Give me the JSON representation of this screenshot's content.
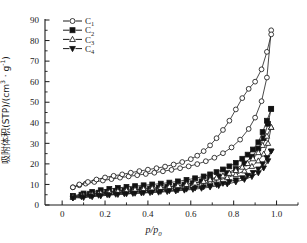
{
  "chart_data": {
    "type": "line",
    "title": "",
    "xlabel": "p/p0",
    "ylabel": "吸附体积(STP)/(cm³ · g⁻¹)",
    "xlim": [
      -0.08,
      1.1
    ],
    "ylim": [
      0,
      90
    ],
    "xticks": [
      0,
      0.2,
      0.4,
      0.6,
      0.8,
      1.0
    ],
    "xtick_labels": [
      "0",
      "0.2",
      "0.4",
      "0.6",
      "0.8",
      "1.0"
    ],
    "yticks": [
      0,
      10,
      20,
      30,
      40,
      50,
      60,
      70,
      80,
      90
    ],
    "ytick_labels": [
      "0",
      "10",
      "20",
      "30",
      "40",
      "50",
      "60",
      "70",
      "80",
      "90"
    ],
    "grid": false,
    "legend_position": "top-left",
    "note": "Nitrogen adsorption-desorption isotherms with hysteresis loops; each sample has an adsorption branch and a desorption branch.",
    "series": [
      {
        "name": "C1",
        "marker": "open-circle",
        "branch": "adsorption",
        "x": [
          0.05,
          0.08,
          0.11,
          0.15,
          0.19,
          0.23,
          0.27,
          0.31,
          0.35,
          0.39,
          0.43,
          0.47,
          0.51,
          0.55,
          0.59,
          0.63,
          0.67,
          0.71,
          0.75,
          0.79,
          0.83,
          0.87,
          0.9,
          0.93,
          0.955,
          0.975
        ],
        "y": [
          8.6,
          9.6,
          10.4,
          11.2,
          11.9,
          12.6,
          13.3,
          13.9,
          14.5,
          15.1,
          15.7,
          16.4,
          17.1,
          17.9,
          18.8,
          19.9,
          21.3,
          23.0,
          25.2,
          28.0,
          31.8,
          37.0,
          42.5,
          50.5,
          62.0,
          85.0
        ]
      },
      {
        "name": "C1",
        "marker": "open-circle",
        "branch": "desorption",
        "x": [
          0.975,
          0.955,
          0.93,
          0.9,
          0.87,
          0.84,
          0.81,
          0.78,
          0.75,
          0.72,
          0.69,
          0.66,
          0.63,
          0.6,
          0.56,
          0.52,
          0.48,
          0.44,
          0.4,
          0.36,
          0.32,
          0.28,
          0.24,
          0.2,
          0.16,
          0.12,
          0.08,
          0.05
        ],
        "y": [
          83.0,
          74.5,
          66.0,
          60.0,
          56.5,
          52.0,
          46.5,
          41.0,
          36.5,
          32.5,
          29.0,
          26.2,
          24.0,
          22.3,
          20.9,
          19.7,
          18.7,
          17.9,
          17.2,
          16.5,
          15.7,
          14.9,
          14.2,
          13.4,
          12.4,
          11.2,
          10.0,
          8.6
        ]
      },
      {
        "name": "C2",
        "marker": "filled-square",
        "branch": "adsorption",
        "x": [
          0.05,
          0.09,
          0.13,
          0.17,
          0.21,
          0.25,
          0.29,
          0.33,
          0.37,
          0.41,
          0.45,
          0.49,
          0.53,
          0.57,
          0.61,
          0.65,
          0.69,
          0.73,
          0.77,
          0.81,
          0.85,
          0.885,
          0.915,
          0.94,
          0.96,
          0.975
        ],
        "y": [
          4.2,
          5.0,
          5.5,
          6.0,
          6.4,
          6.8,
          7.1,
          7.4,
          7.7,
          8.0,
          8.4,
          8.8,
          9.3,
          9.9,
          10.6,
          11.5,
          12.6,
          13.9,
          15.5,
          17.5,
          20.2,
          23.5,
          27.5,
          32.5,
          39.5,
          46.8
        ]
      },
      {
        "name": "C2",
        "marker": "filled-square",
        "branch": "desorption",
        "x": [
          0.975,
          0.955,
          0.935,
          0.915,
          0.89,
          0.865,
          0.84,
          0.81,
          0.78,
          0.75,
          0.72,
          0.69,
          0.66,
          0.62,
          0.58,
          0.54,
          0.5,
          0.46,
          0.42,
          0.38,
          0.34,
          0.3,
          0.26,
          0.22,
          0.18,
          0.14,
          0.1,
          0.05
        ],
        "y": [
          46.8,
          41.0,
          35.5,
          30.5,
          27.0,
          24.5,
          22.5,
          20.5,
          18.8,
          17.3,
          16.0,
          14.9,
          13.9,
          13.0,
          12.2,
          11.5,
          10.9,
          10.4,
          10.0,
          9.6,
          9.2,
          8.8,
          8.3,
          7.8,
          7.2,
          6.4,
          5.6,
          4.4
        ]
      },
      {
        "name": "C3",
        "marker": "open-triangle-up",
        "branch": "adsorption",
        "x": [
          0.05,
          0.09,
          0.13,
          0.17,
          0.21,
          0.25,
          0.29,
          0.33,
          0.37,
          0.41,
          0.45,
          0.49,
          0.53,
          0.57,
          0.61,
          0.65,
          0.69,
          0.73,
          0.77,
          0.81,
          0.85,
          0.885,
          0.915,
          0.94,
          0.96,
          0.975
        ],
        "y": [
          3.8,
          4.5,
          5.0,
          5.4,
          5.8,
          6.1,
          6.4,
          6.7,
          7.0,
          7.3,
          7.6,
          8.0,
          8.4,
          8.9,
          9.5,
          10.2,
          11.1,
          12.1,
          13.3,
          14.8,
          16.6,
          18.8,
          21.5,
          24.8,
          30.0,
          37.8
        ]
      },
      {
        "name": "C3",
        "marker": "open-triangle-up",
        "branch": "desorption",
        "x": [
          0.975,
          0.955,
          0.935,
          0.915,
          0.89,
          0.865,
          0.84,
          0.81,
          0.78,
          0.75,
          0.72,
          0.69,
          0.66,
          0.62,
          0.58,
          0.54,
          0.5,
          0.46,
          0.42,
          0.38,
          0.34,
          0.3,
          0.26,
          0.22,
          0.18,
          0.14,
          0.1,
          0.05
        ],
        "y": [
          37.8,
          33.5,
          29.0,
          25.5,
          22.5,
          20.2,
          18.4,
          16.8,
          15.4,
          14.2,
          13.2,
          12.3,
          11.5,
          10.7,
          10.0,
          9.4,
          8.9,
          8.5,
          8.1,
          7.8,
          7.5,
          7.1,
          6.7,
          6.3,
          5.8,
          5.2,
          4.6,
          3.9
        ]
      },
      {
        "name": "C4",
        "marker": "filled-triangle-down",
        "branch": "adsorption",
        "x": [
          0.05,
          0.09,
          0.13,
          0.17,
          0.21,
          0.25,
          0.29,
          0.33,
          0.37,
          0.41,
          0.45,
          0.49,
          0.53,
          0.57,
          0.61,
          0.65,
          0.69,
          0.73,
          0.77,
          0.81,
          0.85,
          0.885,
          0.915,
          0.94,
          0.96,
          0.975
        ],
        "y": [
          3.4,
          4.0,
          4.4,
          4.7,
          5.0,
          5.2,
          5.4,
          5.6,
          5.8,
          6.0,
          6.2,
          6.5,
          6.8,
          7.2,
          7.6,
          8.1,
          8.7,
          9.4,
          10.2,
          11.2,
          12.4,
          13.8,
          15.6,
          18.0,
          21.5,
          26.2
        ]
      },
      {
        "name": "C4",
        "marker": "filled-triangle-down",
        "branch": "desorption",
        "x": [
          0.975,
          0.955,
          0.935,
          0.915,
          0.89,
          0.865,
          0.84,
          0.81,
          0.78,
          0.75,
          0.72,
          0.69,
          0.66,
          0.62,
          0.58,
          0.54,
          0.5,
          0.46,
          0.42,
          0.38,
          0.34,
          0.3,
          0.26,
          0.22,
          0.18,
          0.14,
          0.1,
          0.05
        ],
        "y": [
          26.2,
          23.0,
          20.0,
          17.5,
          15.8,
          14.4,
          13.2,
          12.2,
          11.3,
          10.5,
          9.9,
          9.3,
          8.8,
          8.2,
          7.7,
          7.3,
          6.9,
          6.6,
          6.3,
          6.0,
          5.7,
          5.4,
          5.1,
          4.8,
          4.4,
          4.0,
          3.6,
          3.4
        ]
      }
    ],
    "legend": [
      {
        "label": "C1",
        "sub": "1",
        "marker": "open-circle"
      },
      {
        "label": "C2",
        "sub": "2",
        "marker": "filled-square"
      },
      {
        "label": "C3",
        "sub": "3",
        "marker": "open-triangle-up"
      },
      {
        "label": "C4",
        "sub": "4",
        "marker": "filled-triangle-down"
      }
    ]
  },
  "axis": {
    "y_label_main": "吸附体积(STP)/(cm",
    "y_label_sup1": "3",
    "y_label_mid": " · g",
    "y_label_sup2": "-1",
    "y_label_end": ")",
    "x_label_num": "p",
    "x_label_den": "p",
    "x_label_den_sub": "0",
    "x_label_slash": "/"
  },
  "colors": {
    "line": "#1a1a1a",
    "background": "#ffffff",
    "marker_fill_open": "#ffffff",
    "marker_fill_solid": "#111111"
  }
}
